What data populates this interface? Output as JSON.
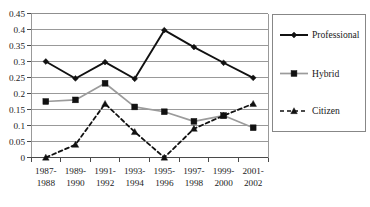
{
  "chart_data": {
    "type": "line",
    "title": "",
    "subtitle": "",
    "xlabel": "",
    "ylabel": "",
    "ylim": [
      0,
      0.45
    ],
    "ytick_labels": [
      "0",
      "0.05",
      "0.1",
      "0.15",
      "0.2",
      "0.25",
      "0.3",
      "0.35",
      "0.4",
      "0.45"
    ],
    "ytick_values": [
      0,
      0.05,
      0.1,
      0.15,
      0.2,
      0.25,
      0.3,
      0.35,
      0.4,
      0.45
    ],
    "grid": true,
    "legend_position": "right",
    "categories": [
      "1987-\n1988",
      "1989-\n1990",
      "1991-\n1992",
      "1993-\n1994",
      "1995-\n1996",
      "1997-\n1998",
      "1999-\n2000",
      "2001-\n2002"
    ],
    "category_lines": [
      [
        "1987-",
        "1988"
      ],
      [
        "1989-",
        "1990"
      ],
      [
        "1991-",
        "1992"
      ],
      [
        "1993-",
        "1994"
      ],
      [
        "1995-",
        "1996"
      ],
      [
        "1997-",
        "1998"
      ],
      [
        "1999-",
        "2000"
      ],
      [
        "2001-",
        "2002"
      ]
    ],
    "series": [
      {
        "name": "Professional",
        "values": [
          0.3,
          0.247,
          0.298,
          0.246,
          0.398,
          0.345,
          0.296,
          0.249
        ],
        "color": "#111111",
        "marker": "diamond",
        "dash": "solid"
      },
      {
        "name": "Hybrid",
        "values": [
          0.175,
          0.18,
          0.232,
          0.158,
          0.143,
          0.113,
          0.131,
          0.093
        ],
        "color": "#9b9b9b",
        "marker": "square",
        "dash": "solid"
      },
      {
        "name": "Citizen",
        "values": [
          0.0,
          0.04,
          0.168,
          0.08,
          0.0,
          0.09,
          0.131,
          0.168
        ],
        "color": "#111111",
        "marker": "triangle",
        "dash": "dashed"
      }
    ]
  },
  "legend": {
    "entries": [
      {
        "label": "Professional"
      },
      {
        "label": "Hybrid"
      },
      {
        "label": "Citizen"
      }
    ]
  }
}
